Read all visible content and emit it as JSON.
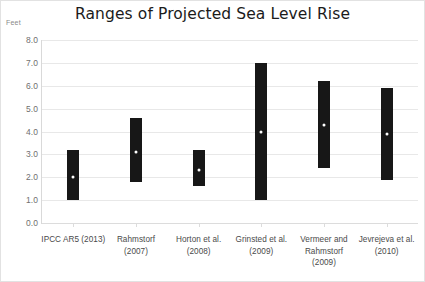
{
  "chart_data": {
    "type": "bar",
    "subtype": "floating-range-bar",
    "title": "Ranges of Projected Sea Level Rise",
    "xlabel": "",
    "ylabel": "Feet",
    "ylim": [
      0.0,
      8.0
    ],
    "ytick_step": 1.0,
    "ytick_labels": [
      "8.0",
      "7.0",
      "6.0",
      "5.0",
      "4.0",
      "3.0",
      "2.0",
      "1.0",
      "0.0"
    ],
    "ytick_values": [
      8.0,
      7.0,
      6.0,
      5.0,
      4.0,
      3.0,
      2.0,
      1.0,
      0.0
    ],
    "grid": true,
    "legend": false,
    "bar_color": "#171717",
    "marker_color": "#ffffff",
    "categories": [
      "IPCC AR5 (2013)",
      "Rahmstorf (2007)",
      "Horton et al. (2008)",
      "Grinsted et al. (2009)",
      "Vermeer and Rahmstorf (2009)",
      "Jevrejeva et al. (2010)"
    ],
    "category_lines": [
      [
        "IPCC AR5 (2013)"
      ],
      [
        "Rahmstorf",
        "(2007)"
      ],
      [
        "Horton et al.",
        "(2008)"
      ],
      [
        "Grinsted et al.",
        "(2009)"
      ],
      [
        "Vermeer and",
        "Rahmstorf",
        "(2009)"
      ],
      [
        "Jevrejeva et al.",
        "(2010)"
      ]
    ],
    "series": [
      {
        "name": "low",
        "values": [
          1.0,
          1.8,
          1.6,
          1.0,
          2.4,
          1.9
        ]
      },
      {
        "name": "high",
        "values": [
          3.2,
          4.6,
          3.2,
          7.0,
          6.2,
          5.9
        ]
      },
      {
        "name": "central",
        "values": [
          2.0,
          3.1,
          2.3,
          4.0,
          4.3,
          3.9
        ]
      }
    ],
    "points": [
      {
        "category": "IPCC AR5 (2013)",
        "low": 1.0,
        "high": 3.2,
        "central": 2.0
      },
      {
        "category": "Rahmstorf (2007)",
        "low": 1.8,
        "high": 4.6,
        "central": 3.1
      },
      {
        "category": "Horton et al. (2008)",
        "low": 1.6,
        "high": 3.2,
        "central": 2.3
      },
      {
        "category": "Grinsted et al. (2009)",
        "low": 1.0,
        "high": 7.0,
        "central": 4.0
      },
      {
        "category": "Vermeer and Rahmstorf (2009)",
        "low": 2.4,
        "high": 6.2,
        "central": 4.3
      },
      {
        "category": "Jevrejeva et al. (2010)",
        "low": 1.9,
        "high": 5.9,
        "central": 3.9
      }
    ]
  }
}
